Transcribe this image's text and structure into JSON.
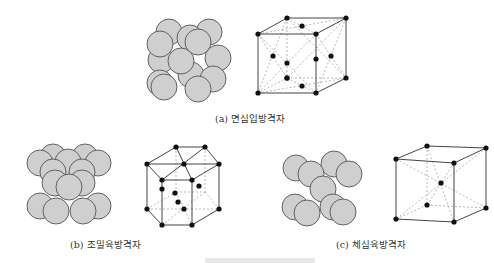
{
  "figure": {
    "panels": [
      {
        "id": "a",
        "caption": "(a) 면심입방격자",
        "structure": "face-centered cubic",
        "atoms_in_lattice": 14
      },
      {
        "id": "b",
        "caption": "(b) 조밀육방격자",
        "structure": "hexagonal close-packed"
      },
      {
        "id": "c",
        "caption": "(c) 체심육방격자",
        "structure": "body-centered cubic",
        "atoms_in_lattice": 9
      }
    ],
    "colors": {
      "sphere_fill": "#cfcfcf",
      "sphere_stroke": "#555555",
      "atom": "#111111",
      "edge": "#444444",
      "hidden_edge": "#999999"
    }
  }
}
